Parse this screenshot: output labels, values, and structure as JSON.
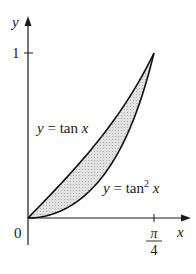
{
  "figure": {
    "type": "area-between-curves",
    "axes": {
      "x_label": "x",
      "y_label": "y",
      "origin_label": "0",
      "y_tick_label": "1",
      "x_tick_label_num": "π",
      "x_tick_label_den": "4"
    },
    "curves": [
      {
        "name": "upper",
        "label_lhs": "y = tan",
        "label_var": "x",
        "expr": "tan x"
      },
      {
        "name": "lower",
        "label_lhs": "y = tan",
        "label_sup": "2",
        "label_var": "x",
        "expr": "tan^2 x"
      }
    ],
    "region": {
      "between": [
        "tan x",
        "tan^2 x"
      ],
      "x_range": [
        "0",
        "π/4"
      ],
      "fill_color": "#d9d9d9"
    },
    "colors": {
      "axis": "#1a1a1a",
      "curve": "#111111",
      "shade": "#d9d9d9"
    }
  }
}
